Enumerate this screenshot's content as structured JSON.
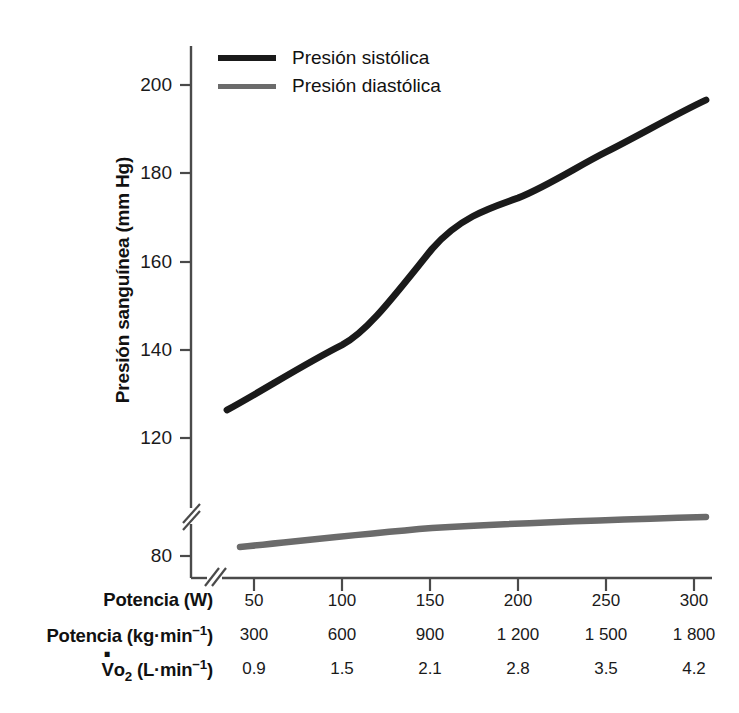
{
  "chart_data": {
    "type": "line",
    "title": "",
    "ylabel": "Presión sanguínea (mm Hg)",
    "xlabel": "",
    "ylim": [
      76,
      208
    ],
    "y_ticks": [
      200,
      180,
      160,
      140,
      120,
      80
    ],
    "y_axis_break": true,
    "y_break_between": [
      120,
      80
    ],
    "x_axis_break": true,
    "grid": false,
    "legend_position": "top-left-inside",
    "categories": [
      50,
      100,
      150,
      200,
      250,
      300
    ],
    "series": [
      {
        "name": "Presión sistólica",
        "color": "#1a1a1a",
        "values": [
          126,
          142,
          163,
          172,
          182,
          196
        ]
      },
      {
        "name": "Presión diastólica",
        "color": "#6b6b6b",
        "values": [
          81.5,
          83.5,
          85,
          85.6,
          86.2,
          86.8
        ]
      }
    ],
    "x_axis_rows": [
      {
        "label": "Potencia (W)",
        "label_html": "Potencia (W)",
        "values": [
          "50",
          "100",
          "150",
          "200",
          "250",
          "300"
        ]
      },
      {
        "label": "Potencia (kg·min⁻¹)",
        "label_html": "Potencia (kg·min<sup class=\"ex\">−1</sup>)",
        "values": [
          "300",
          "600",
          "900",
          "1 200",
          "1 500",
          "1 800"
        ]
      },
      {
        "label": "V̇o₂ (L·min⁻¹)",
        "label_html": "<span class=\"vdot\">V</span>o<sub class=\"sb\">2</sub> (L·min<sup class=\"ex\">−1</sup>)",
        "values": [
          "0.9",
          "1.5",
          "2.1",
          "2.8",
          "3.5",
          "4.2"
        ]
      }
    ]
  },
  "legend": {
    "items": [
      {
        "label": "Presión sistólica",
        "color": "#1a1a1a"
      },
      {
        "label": "Presión diastólica",
        "color": "#6b6b6b"
      }
    ]
  },
  "axis": {
    "y_title": "Presión sanguínea (mm Hg)",
    "y_tick_labels": [
      "200",
      "180",
      "160",
      "140",
      "120",
      "80"
    ],
    "axis_color": "#4a4a4a"
  },
  "colors": {
    "systolic": "#1a1a1a",
    "diastolic": "#6b6b6b",
    "axis": "#4a4a4a",
    "background": "#ffffff",
    "text": "#111111"
  }
}
